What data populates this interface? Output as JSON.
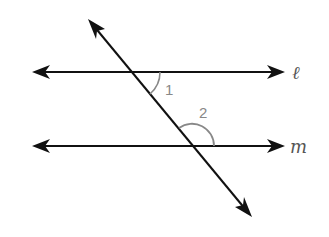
{
  "diagram": {
    "type": "parallel-lines-with-transversal",
    "lines": [
      {
        "id": "l",
        "label": "ℓ"
      },
      {
        "id": "m",
        "label": "m"
      }
    ],
    "transversal": {
      "label": ""
    },
    "angles": [
      {
        "id": "1",
        "label": "1",
        "position": "below line l, right of transversal"
      },
      {
        "id": "2",
        "label": "2",
        "position": "above line m, right of transversal"
      }
    ],
    "colors": {
      "line": "#111111",
      "arc": "#888888",
      "label": "#666666"
    }
  }
}
